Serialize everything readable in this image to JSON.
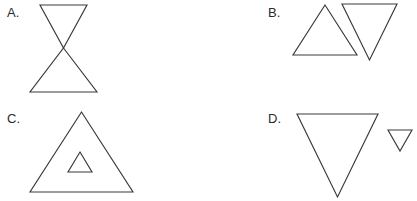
{
  "sheet": {
    "width": 417,
    "height": 201,
    "background_color": "#ffffff",
    "stroke_color": "#3a3a3a",
    "label_color": "#2b2b2b"
  },
  "options": [
    {
      "id": "a",
      "label": "A.",
      "description": "hourglass of two triangles meeting tip to tip",
      "shapes": [
        {
          "name": "down-triangle-upper",
          "orientation": "down",
          "points": "40,5 87,5 63.5,48"
        },
        {
          "name": "up-triangle-lower",
          "orientation": "up",
          "points": "63.5,48 97,92 30,92"
        }
      ]
    },
    {
      "id": "b",
      "label": "B.",
      "description": "up triangle and down triangle side by side overlapping",
      "shapes": [
        {
          "name": "up-triangle-left",
          "orientation": "up",
          "points": "325,5 357,55 293,55"
        },
        {
          "name": "down-triangle-right",
          "orientation": "down",
          "points": "342,4 397,4 369.5,60"
        }
      ]
    },
    {
      "id": "c",
      "label": "C.",
      "description": "large up triangle containing a small up triangle",
      "shapes": [
        {
          "name": "up-triangle-outer",
          "orientation": "up",
          "points": "81.5,112 133,192 30,192"
        },
        {
          "name": "up-triangle-inner",
          "orientation": "up",
          "points": "80,152 92,172 68,172"
        }
      ]
    },
    {
      "id": "d",
      "label": "D.",
      "description": "large down triangle beside a small down triangle",
      "shapes": [
        {
          "name": "down-triangle-large",
          "orientation": "down",
          "points": "297,114 378,114 337.5,197"
        },
        {
          "name": "down-triangle-small",
          "orientation": "down",
          "points": "388,130 412,130 400,151"
        }
      ]
    }
  ]
}
